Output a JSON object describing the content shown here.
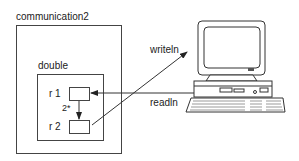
{
  "diagram": {
    "outer_box": {
      "label": "communication2"
    },
    "inner_box": {
      "label": "double"
    },
    "registers": [
      {
        "label": "r 1"
      },
      {
        "label": "r 2"
      }
    ],
    "internal_arrow": {
      "label": "2*",
      "from": "r 1",
      "to": "r 2"
    },
    "io_arrows": [
      {
        "label": "writeln",
        "from": "r 2",
        "to": "computer"
      },
      {
        "label": "readln",
        "from": "computer",
        "to": "r 1"
      }
    ],
    "computer": {
      "icon": "desktop-computer-icon"
    },
    "colors": {
      "stroke": "#444444",
      "text": "#222222",
      "background": "#ffffff"
    }
  }
}
